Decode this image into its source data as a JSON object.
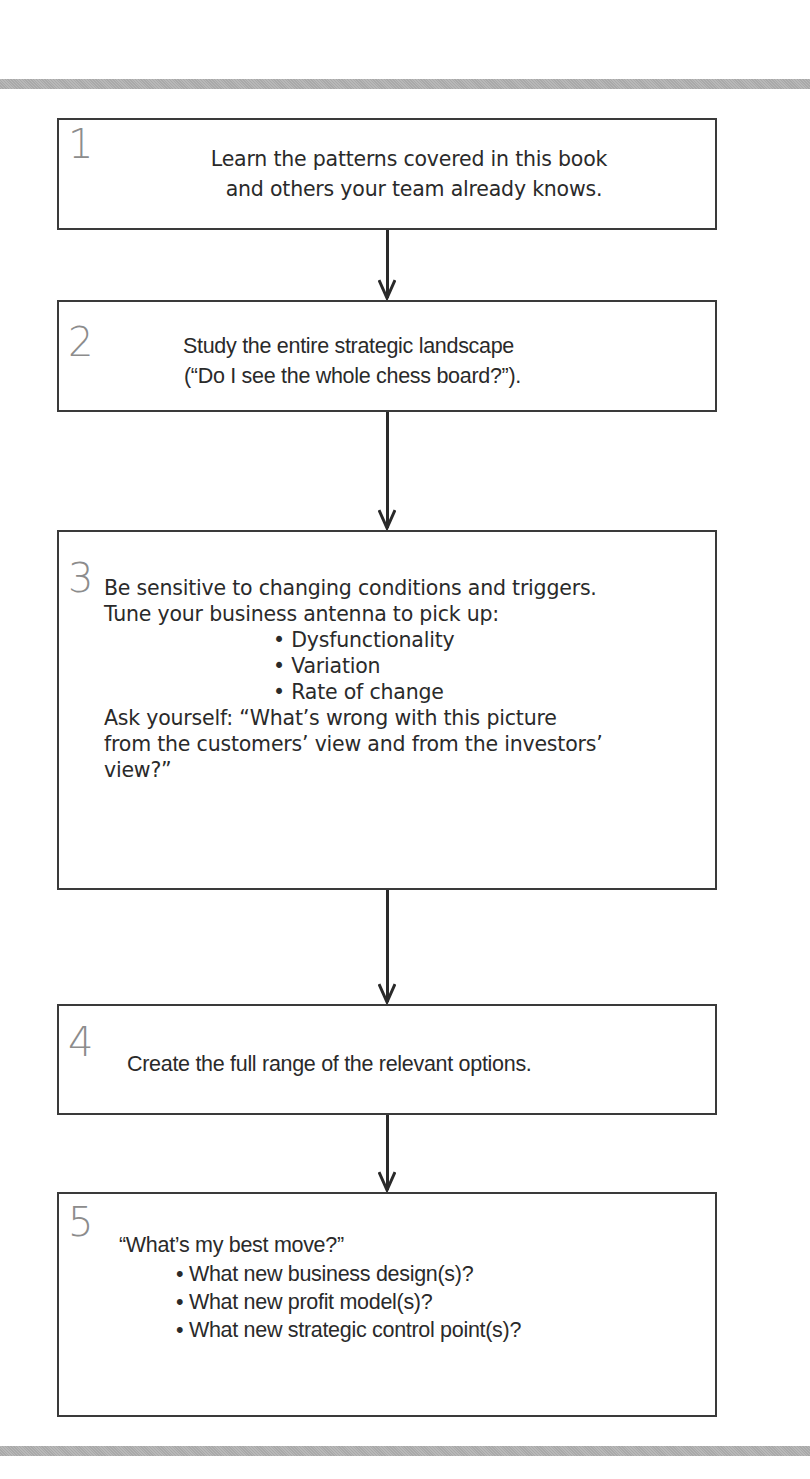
{
  "diagram": {
    "type": "vertical-flowchart",
    "steps": [
      {
        "number": "1",
        "lines": [
          "Learn the patterns covered in this book",
          "and others your team already knows."
        ]
      },
      {
        "number": "2",
        "lines": [
          "Study the entire strategic landscape",
          "(“Do I see the whole chess board?”)."
        ]
      },
      {
        "number": "3",
        "intro": [
          "Be sensitive to changing conditions and triggers.",
          "Tune your business antenna to pick up:"
        ],
        "bullets": [
          "Dysfunctionality",
          "Variation",
          "Rate of change"
        ],
        "outro": [
          "Ask yourself:  “What’s wrong with this picture",
          "from the customers’ view and from the investors’",
          "view?”"
        ]
      },
      {
        "number": "4",
        "lines": [
          "Create the full range of the relevant options."
        ]
      },
      {
        "number": "5",
        "intro": [
          "“What’s my best move?”"
        ],
        "bullets": [
          "What new business design(s)?",
          "What new profit model(s)?",
          "What new strategic control point(s)?"
        ]
      }
    ],
    "bullet_glyph": "•",
    "colors": {
      "border": "#3a3a3a",
      "text": "#2a2a2a",
      "step_number": "#8c8c8c",
      "rule_bar": "#b0b0b0"
    }
  }
}
